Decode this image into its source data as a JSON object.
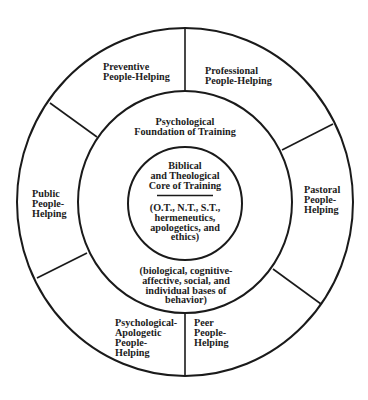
{
  "diagram": {
    "colors": {
      "stroke": "#1a1a1a",
      "text": "#1c1c1c",
      "background": "#ffffff"
    },
    "inner_core": {
      "title_lines": [
        "Biblical",
        "and Theological",
        "Core of Training"
      ],
      "detail_lines": [
        "(O.T., N.T., S.T.,",
        "hermeneutics,",
        "apologetics, and",
        "ethics)"
      ]
    },
    "middle_ring": {
      "title_lines": [
        "Psychological",
        "Foundation of Training"
      ],
      "detail_lines": [
        "(biological, cognitive-",
        "affective, social, and",
        "individual bases of",
        "behavior)"
      ]
    },
    "outer_segments": [
      {
        "id": "preventive",
        "lines": [
          "Preventive",
          "People-Helping"
        ]
      },
      {
        "id": "professional",
        "lines": [
          "Professional",
          "People-Helping"
        ]
      },
      {
        "id": "pastoral",
        "lines": [
          "Pastoral",
          "People-",
          "Helping"
        ]
      },
      {
        "id": "peer",
        "lines": [
          "Peer",
          "People-",
          "Helping"
        ]
      },
      {
        "id": "psychological-apologetic",
        "lines": [
          "Psychological-",
          "Apologetic",
          "People-",
          "Helping"
        ]
      },
      {
        "id": "public",
        "lines": [
          "Public",
          "People-",
          "Helping"
        ]
      }
    ]
  }
}
